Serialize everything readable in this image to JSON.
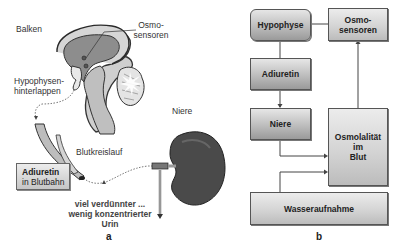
{
  "panel_a": {
    "letter": "a",
    "labels": {
      "balken": "Balken",
      "osmo_line1": "Osmo-",
      "osmo_line2": "sensoren",
      "hyp_line1": "Hypophysen-",
      "hyp_line2": "hinterlappen",
      "niere": "Niere",
      "blutkreislauf": "Blutkreislauf",
      "adiuretin": "Adiuretin",
      "in_blutbahn": "in Blutbahn",
      "urin_line1": "viel verdünnter ...",
      "urin_line2": "wenig konzentrierter",
      "urin_line3": "Urin"
    }
  },
  "panel_b": {
    "letter": "b",
    "boxes": {
      "hypophyse": "Hypophyse",
      "osmo_line1": "Osmo-",
      "osmo_line2": "sensoren",
      "adiuretin": "Adiuretin",
      "niere": "Niere",
      "osmolalitaet_line1": "Osmolalität",
      "osmolalitaet_line2": "im",
      "osmolalitaet_line3": "Blut",
      "wasseraufnahme": "Wasseraufnahme"
    },
    "edges": [
      {
        "from": "Osmosensoren",
        "to": "Hypophyse"
      },
      {
        "from": "Hypophyse",
        "to": "Adiuretin"
      },
      {
        "from": "Adiuretin",
        "to": "Niere"
      },
      {
        "from": "Niere",
        "to": "Osmolalität im Blut"
      },
      {
        "from": "Wasseraufnahme",
        "to": "Osmolalität im Blut"
      },
      {
        "from": "Osmolalität im Blut",
        "to": "Osmosensoren"
      }
    ]
  },
  "colors": {
    "box_fill_top": "#e6e6e6",
    "box_fill_bottom": "#9a9a9a",
    "brain_outer": "#d0d0d0",
    "brain_inner": "#8a8a8a",
    "kidney": "#4a4a4a",
    "line": "#555555"
  }
}
